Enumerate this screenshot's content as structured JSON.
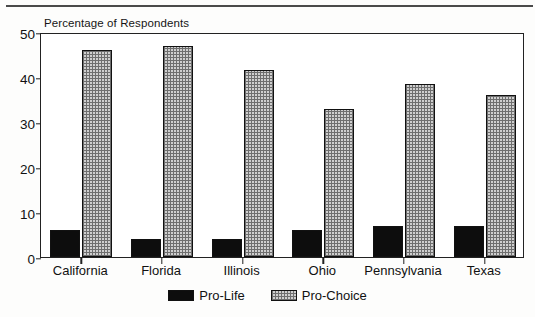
{
  "chart_data": {
    "type": "bar",
    "title": "Percentage of Respondents",
    "xlabel": "",
    "ylabel": "",
    "ylim": [
      0,
      50
    ],
    "yticks": [
      0,
      10,
      20,
      30,
      40,
      50
    ],
    "grid": false,
    "legend_position": "bottom-center",
    "categories": [
      "California",
      "Florida",
      "Illinois",
      "Ohio",
      "Pennsylvania",
      "Texas"
    ],
    "series": [
      {
        "name": "Pro-Life",
        "values": [
          6,
          4,
          4,
          6,
          7,
          7
        ]
      },
      {
        "name": "Pro-Choice",
        "values": [
          46,
          47,
          41.5,
          33,
          38.5,
          36
        ]
      }
    ]
  },
  "legend": {
    "items": [
      {
        "label": "Pro-Life",
        "swatch": "solid-black-swatch"
      },
      {
        "label": "Pro-Choice",
        "swatch": "gray-hatched-swatch"
      }
    ]
  }
}
